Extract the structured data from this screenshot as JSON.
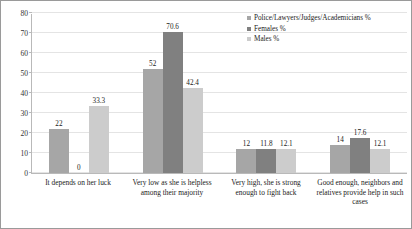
{
  "chart_data": {
    "type": "bar",
    "title": "",
    "xlabel": "",
    "ylabel": "",
    "ylim": [
      0,
      80
    ],
    "ytick_step": 10,
    "yticks": [
      "0",
      "10",
      "20",
      "30",
      "40",
      "50",
      "60",
      "70",
      "80"
    ],
    "grid": true,
    "legend_position": "top-right",
    "categories": [
      "It depends on her luck",
      "Very low as she is helpless among their majority",
      "Very high, she is strong enough to fight back",
      "Good enough, neighbors and relatives provide help in such cases"
    ],
    "series": [
      {
        "name": "Police/Lawyers/Judges/Academicians %",
        "color": "#a6a6a6",
        "values": [
          22,
          52,
          12,
          14
        ],
        "labels": [
          "22",
          "52",
          "12",
          "14"
        ]
      },
      {
        "name": "Females %",
        "color": "#808080",
        "values": [
          0,
          70.6,
          11.8,
          17.6
        ],
        "labels": [
          "0",
          "70.6",
          "11.8",
          "17.6"
        ]
      },
      {
        "name": "Males %",
        "color": "#cccccc",
        "values": [
          33.3,
          42.4,
          12.1,
          12.1
        ],
        "labels": [
          "33.3",
          "42.4",
          "12.1",
          "12.1"
        ]
      }
    ]
  },
  "colors": {
    "frame_border": "#9a9a9a",
    "gridline": "#e4e4e4",
    "axis_line": "#b9b9b9",
    "background": "#ffffff",
    "text": "#222222"
  }
}
